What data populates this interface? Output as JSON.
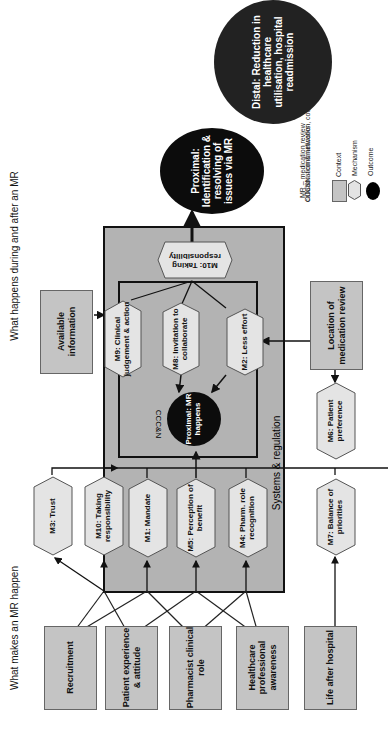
{
  "headers": {
    "left": "What makes an MR happen",
    "right": "What happens during and after an MR"
  },
  "context_boxes": [
    {
      "id": "recruitment",
      "label": "Recruitment"
    },
    {
      "id": "patient-experience",
      "label": "Patient experience & attitude"
    },
    {
      "id": "pharmacist-role",
      "label": "Pharmacist clinical role"
    },
    {
      "id": "hcp-awareness",
      "label": "Healthcare professional awareness"
    },
    {
      "id": "life-after-hospital",
      "label": "Life after hospital"
    },
    {
      "id": "available-information",
      "label": "Available information"
    },
    {
      "id": "location",
      "label": "Location of medication review"
    }
  ],
  "mechanisms": {
    "m3": "M3: Trust",
    "m10a": "M10: Taking responsibility",
    "m1": "M1: Mandate",
    "m5": "M5: Perception of benefit",
    "m4": "M4: Pharm. role recognition",
    "m7": "M7: Balance of priorities",
    "m6": "M6: Patient preference",
    "m9": "M9: Clinical judgement & action",
    "m8": "M8: Invitation to collaborate",
    "m2": "M2: Less effort",
    "m10b": "M10: Taking responsibility"
  },
  "regions": {
    "systems": "Systems & regulation",
    "cccn": "CCC&N"
  },
  "outcomes": {
    "proximal_mr": "Proximal: MR happens",
    "proximal_id": "Proximal: Identification & resolving of issues via MR",
    "distal": "Distal: Reduction in healthcare utilisation, hospital readmission"
  },
  "legend": {
    "line1": "MR – medication review",
    "line2": "CCC&N - communication, coordination,",
    "line3": "collaboration & networks",
    "context": "Context",
    "mechanism": "Mechanism",
    "outcome": "Outcome"
  },
  "colors": {
    "context_fill": "#c4c4c4",
    "mechanism_fill": "#e4e4e4",
    "systems_fill": "#b3b3b3",
    "outcome_fill": "#0c0c0c"
  }
}
